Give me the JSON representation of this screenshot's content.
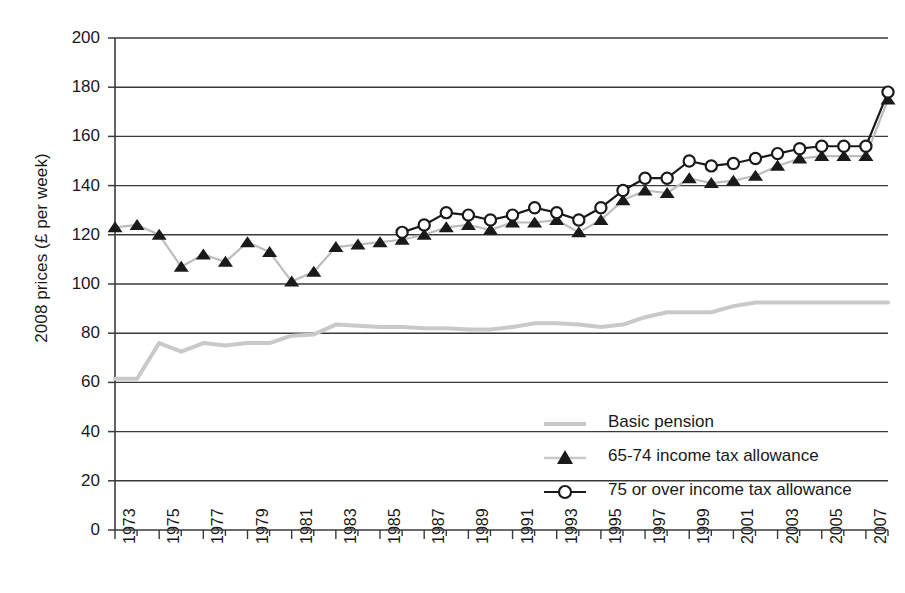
{
  "chart_data": {
    "type": "line",
    "title": "",
    "xlabel": "",
    "ylabel": "2008 prices (£ per week)",
    "ylim": [
      0,
      200
    ],
    "ytick_values": [
      0,
      20,
      40,
      60,
      80,
      100,
      120,
      140,
      160,
      180,
      200
    ],
    "ytick_labels": [
      "0",
      "20",
      "40",
      "60",
      "80",
      "100",
      "120",
      "140",
      "160",
      "180",
      "200"
    ],
    "xlim": [
      1973,
      2008
    ],
    "x": [
      1973,
      1974,
      1975,
      1976,
      1977,
      1978,
      1979,
      1980,
      1981,
      1982,
      1983,
      1984,
      1985,
      1986,
      1987,
      1988,
      1989,
      1990,
      1991,
      1992,
      1993,
      1994,
      1995,
      1996,
      1997,
      1998,
      1999,
      2000,
      2001,
      2002,
      2003,
      2004,
      2005,
      2006,
      2007,
      2008
    ],
    "xtick_labels": [
      "1973",
      "1975",
      "1977",
      "1979",
      "1981",
      "1983",
      "1985",
      "1987",
      "1989",
      "1991",
      "1993",
      "1995",
      "1997",
      "1999",
      "2001",
      "2003",
      "2005",
      "2007"
    ],
    "xtick_values": [
      1973,
      1975,
      1977,
      1979,
      1981,
      1983,
      1985,
      1987,
      1989,
      1991,
      1993,
      1995,
      1997,
      1999,
      2001,
      2003,
      2005,
      2007
    ],
    "grid": "horizontal",
    "legend_position": "lower-right",
    "series": [
      {
        "name": "Basic pension",
        "marker": "none",
        "color": "#c9c9c9",
        "values": [
          61.5,
          61.5,
          76,
          72.5,
          76,
          75,
          76,
          76,
          79,
          79.5,
          83.5,
          83,
          82.5,
          82.5,
          82,
          82,
          81.5,
          81.5,
          82.5,
          84,
          84,
          83.5,
          82.5,
          83.5,
          86.5,
          88.5,
          88.5,
          88.5,
          91,
          92.5,
          92.5,
          92.5,
          92.5,
          92.5,
          92.5,
          92.5
        ]
      },
      {
        "name": "65-74 income tax allowance",
        "marker": "triangle",
        "color": "#1a1a1a",
        "values": [
          123,
          124,
          120,
          107,
          112,
          109,
          117,
          113,
          101,
          105,
          115,
          116,
          117,
          118,
          120,
          123,
          124,
          122,
          125,
          125,
          126,
          121,
          126,
          134,
          138,
          137,
          143,
          141,
          142,
          144,
          148,
          151,
          152,
          152,
          152,
          175
        ]
      },
      {
        "name": "75 or over income tax allowance",
        "marker": "circle",
        "color": "#1a1a1a",
        "values": [
          null,
          null,
          null,
          null,
          null,
          null,
          null,
          null,
          null,
          null,
          null,
          null,
          null,
          121,
          124,
          129,
          128,
          126,
          128,
          131,
          129,
          126,
          131,
          138,
          143,
          143,
          150,
          148,
          149,
          151,
          153,
          155,
          156,
          156,
          156,
          178
        ]
      }
    ]
  },
  "legend": {
    "items": [
      {
        "label": "Basic pension",
        "key": "line-grey"
      },
      {
        "label": "65-74 income tax allowance",
        "key": "line-triangle"
      },
      {
        "label": "75 or over income tax allowance",
        "key": "line-circle"
      }
    ]
  },
  "colors": {
    "pension": "#c9c9c9",
    "allowance": "#1a1a1a",
    "axis": "#3a3a3a",
    "grid": "#3a3a3a",
    "background": "#ffffff"
  }
}
